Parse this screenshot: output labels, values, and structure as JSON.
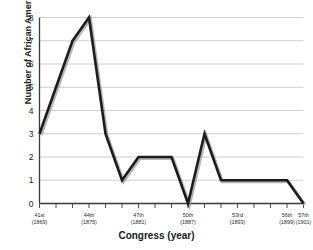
{
  "chart_data": {
    "type": "line",
    "title": "",
    "xlabel": "Congress (year)",
    "ylabel": "Number of African Americans",
    "ylim": [
      0,
      8
    ],
    "yticks": [
      0,
      1,
      2,
      3,
      4,
      5,
      6,
      7,
      8
    ],
    "grid": true,
    "legend": null,
    "categories": [
      "41st",
      "42nd",
      "43rd",
      "44th",
      "45th",
      "46th",
      "47th",
      "48th",
      "49th",
      "50th",
      "51st",
      "52nd",
      "53rd",
      "54th",
      "55th",
      "56th",
      "57th"
    ],
    "x_tick_labels": [
      {
        "index": 0,
        "line1": "41st",
        "line2": "(1869)"
      },
      {
        "index": 3,
        "line1": "44th",
        "line2": "(1875)"
      },
      {
        "index": 6,
        "line1": "47th",
        "line2": "(1881)"
      },
      {
        "index": 9,
        "line1": "50th",
        "line2": "(1887)"
      },
      {
        "index": 12,
        "line1": "53rd",
        "line2": "(1893)"
      },
      {
        "index": 15,
        "line1": "56th",
        "line2": "(1899)"
      },
      {
        "index": 16,
        "line1": "57th",
        "line2": "(1901)"
      }
    ],
    "values": [
      3,
      5,
      7,
      8,
      3,
      1,
      2,
      2,
      2,
      0,
      3,
      1,
      1,
      1,
      1,
      1,
      0
    ],
    "colors": {
      "line": "#1c1c1c",
      "line_shadow": "#8f8f8f",
      "grid": "#b9b9b9",
      "axis": "#3a3a3a",
      "text": "#1a1a1a",
      "background": "#ffffff"
    }
  }
}
